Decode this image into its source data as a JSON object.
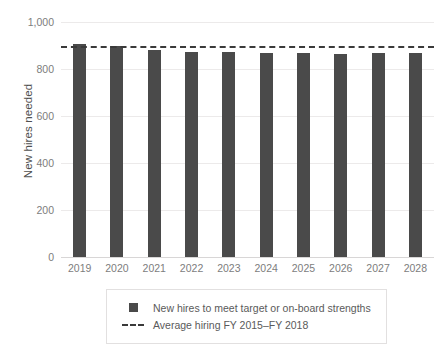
{
  "chart_data": {
    "type": "bar",
    "title": "",
    "xlabel": "",
    "ylabel": "New hires needed",
    "categories": [
      "2019",
      "2020",
      "2021",
      "2022",
      "2023",
      "2024",
      "2025",
      "2026",
      "2027",
      "2028"
    ],
    "series": [
      {
        "name": "New hires to meet target or on-board strengths",
        "type": "bar",
        "color": "#4a4a4a",
        "values": [
          907,
          897,
          880,
          874,
          872,
          868,
          870,
          866,
          870,
          870
        ]
      },
      {
        "name": "Average hiring FY 2015–FY 2018",
        "type": "hline",
        "style": "dashed",
        "color": "#3a3a3a",
        "value": 898
      }
    ],
    "ylim": [
      0,
      1000
    ],
    "yticks": [
      0,
      200,
      400,
      600,
      800,
      1000
    ],
    "ytick_labels": [
      "0",
      "200",
      "400",
      "600",
      "800",
      "1,000"
    ],
    "grid": true,
    "legend_position": "bottom"
  },
  "legend": {
    "items": [
      {
        "marker": "square-swatch",
        "label": "New hires to meet target or on-board strengths"
      },
      {
        "marker": "dashed-line-swatch",
        "label": "Average hiring FY 2015–FY 2018"
      }
    ]
  }
}
